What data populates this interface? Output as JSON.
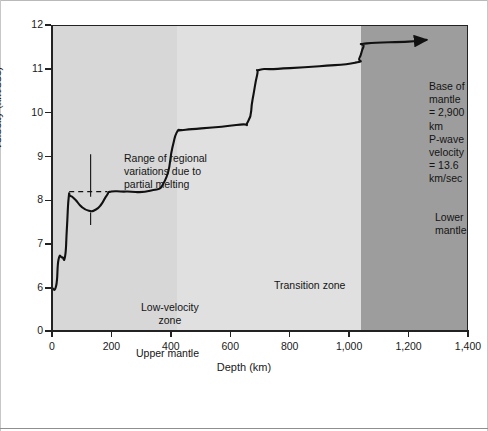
{
  "figure": {
    "kind": "seismic-velocity-depth-profile",
    "background_color": "#ffffff"
  },
  "axes": {
    "y_title": "Velocity (km/sec)",
    "x_title": "Depth (km)"
  },
  "zones": {
    "upper_mantle": {
      "label": "Upper mantle",
      "color": "#d7d7d7",
      "from_km": 0,
      "to_km": 420
    },
    "transition_zone": {
      "label": "Transition zone",
      "color": "#e0e0e0",
      "from_km": 420,
      "to_km": 1040
    },
    "lower_mantle": {
      "label": "Lower mantle",
      "color": "#9d9d9d",
      "from_km": 1040,
      "to_km": 1400
    }
  },
  "annotations": {
    "low_velocity_zone": "Low-velocity\nzone",
    "range_regional": "Range of regional\nvariations due to\npartial melting",
    "base_of_mantle": "Base of mantle\n= 2,900 km\nP-wave velocity\n= 13.6 km/sec"
  },
  "chart_data": {
    "type": "line",
    "title": "",
    "xlabel": "Depth (km)",
    "ylabel": "Velocity (km/sec)",
    "xlim": [
      0,
      1400
    ],
    "ylim": [
      6,
      12
    ],
    "y_axis_break": true,
    "y_break_note": "axis shows 0 then jumps to 6",
    "xticks": [
      0,
      200,
      400,
      600,
      800,
      1000,
      1200,
      1400
    ],
    "xtick_labels": [
      "0",
      "200",
      "400",
      "600",
      "800",
      "1,000",
      "1,200",
      "1,400"
    ],
    "yticks": [
      0,
      6,
      7,
      8,
      9,
      10,
      11,
      12
    ],
    "ytick_labels": [
      "0",
      "6",
      "7",
      "8",
      "9",
      "10",
      "11",
      "12"
    ],
    "grid": false,
    "legend": false,
    "line_color": "#111111",
    "series": [
      {
        "name": "P-wave velocity",
        "x": [
          0,
          14,
          22,
          34,
          44,
          50,
          56,
          62,
          78,
          100,
          125,
          145,
          165,
          185,
          200,
          250,
          330,
          380,
          405,
          420,
          435,
          450,
          620,
          660,
          675,
          690,
          700,
          760,
          900,
          1020,
          1035,
          1048,
          1060,
          1200,
          1260
        ],
        "y": [
          6.0,
          6.05,
          6.65,
          6.7,
          6.72,
          7.35,
          8.05,
          8.1,
          8.02,
          7.85,
          7.76,
          7.78,
          7.9,
          8.12,
          8.2,
          8.2,
          8.22,
          8.45,
          9.2,
          9.55,
          9.6,
          9.61,
          9.72,
          9.8,
          10.3,
          10.85,
          10.98,
          11.0,
          11.06,
          11.14,
          11.25,
          11.5,
          11.58,
          11.62,
          11.66
        ]
      }
    ],
    "dashed_reference": {
      "y": 8.2,
      "x_from": 58,
      "x_to": 186,
      "note": "upper bound of regional variation band"
    },
    "arrow": {
      "note": "curve continues off-chart toward base of mantle",
      "to_x": 1250,
      "to_y": 11.66
    }
  }
}
